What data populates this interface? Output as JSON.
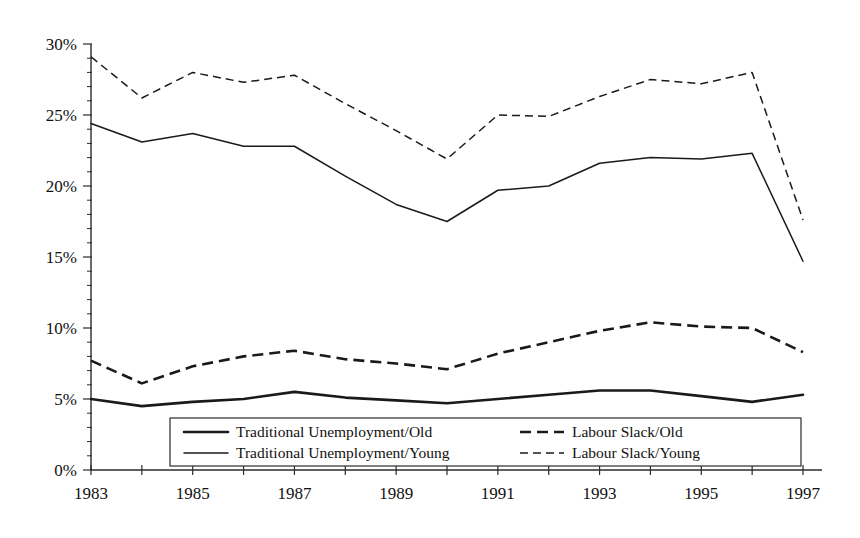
{
  "chart_data": {
    "type": "line",
    "title": "",
    "subtitle": "",
    "xlabel": "",
    "ylabel": "",
    "x": [
      1983,
      1984,
      1985,
      1986,
      1987,
      1988,
      1989,
      1990,
      1991,
      1992,
      1993,
      1994,
      1995,
      1996,
      1997
    ],
    "xlim": [
      1983,
      1997
    ],
    "ylim": [
      0,
      30
    ],
    "y_unit": "%",
    "grid": false,
    "legend_position": "bottom-inside",
    "x_tick_labels": [
      "1983",
      "",
      "1985",
      "",
      "1987",
      "",
      "1989",
      "",
      "1991",
      "",
      "1993",
      "",
      "1995",
      "",
      "1997"
    ],
    "y_tick_labels": [
      "0%",
      "5%",
      "10%",
      "15%",
      "20%",
      "25%",
      "30%"
    ],
    "y_ticks": [
      0,
      5,
      10,
      15,
      20,
      25,
      30
    ],
    "y_minor_tick_step": 1,
    "series": [
      {
        "name": "Traditional Unemployment/Old",
        "style": "solid-thick",
        "values": [
          5.0,
          4.5,
          4.8,
          5.0,
          5.5,
          5.1,
          4.9,
          4.7,
          5.0,
          5.3,
          5.6,
          5.6,
          5.2,
          4.8,
          5.3
        ]
      },
      {
        "name": "Traditional Unemployment/Young",
        "style": "solid-thin",
        "values": [
          24.4,
          23.1,
          23.7,
          22.8,
          22.8,
          20.7,
          18.7,
          17.5,
          19.7,
          20.0,
          21.6,
          22.0,
          21.9,
          22.3,
          14.7
        ]
      },
      {
        "name": "Labour Slack/Old",
        "style": "dashed-thick",
        "values": [
          7.7,
          6.1,
          7.3,
          8.0,
          8.4,
          7.8,
          7.5,
          7.1,
          8.2,
          9.0,
          9.8,
          10.4,
          10.1,
          10.0,
          8.3
        ]
      },
      {
        "name": "Labour Slack/Young",
        "style": "dashed-thin",
        "values": [
          29.1,
          26.2,
          28.0,
          27.3,
          27.8,
          25.8,
          23.9,
          21.9,
          25.0,
          24.9,
          26.3,
          27.5,
          27.2,
          28.0,
          17.6
        ]
      }
    ]
  },
  "legend": {
    "entries": [
      {
        "label": "Traditional Unemployment/Old",
        "style": "solid-thick"
      },
      {
        "label": "Labour Slack/Old",
        "style": "dashed-thick"
      },
      {
        "label": "Traditional Unemployment/Young",
        "style": "solid-thin"
      },
      {
        "label": "Labour Slack/Young",
        "style": "dashed-thin"
      }
    ]
  }
}
